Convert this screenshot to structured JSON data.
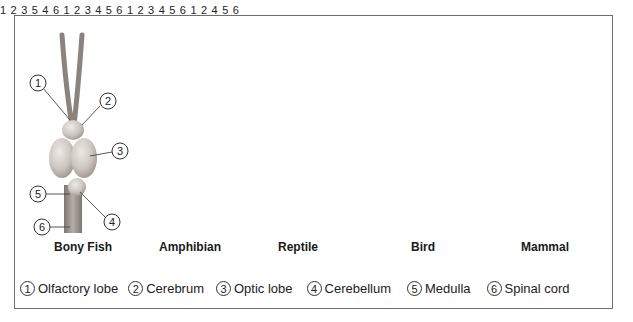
{
  "diagram": {
    "animals": [
      {
        "id": "bony-fish",
        "caption": "Bony Fish"
      },
      {
        "id": "amphibian",
        "caption": "Amphibian"
      },
      {
        "id": "reptile",
        "caption": "Reptile"
      },
      {
        "id": "bird",
        "caption": "Bird"
      },
      {
        "id": "mammal",
        "caption": "Mammal"
      }
    ],
    "callout_numbers": [
      "1",
      "2",
      "3",
      "4",
      "5",
      "6"
    ]
  },
  "legend": [
    {
      "num": "1",
      "label": "Olfactory lobe"
    },
    {
      "num": "2",
      "label": "Cerebrum"
    },
    {
      "num": "3",
      "label": "Optic lobe"
    },
    {
      "num": "4",
      "label": "Cerebellum"
    },
    {
      "num": "5",
      "label": "Medulla"
    },
    {
      "num": "6",
      "label": "Spinal cord"
    }
  ],
  "colors": {
    "frame": "#6e6e6e",
    "brain_light": "#e2ddd8",
    "brain_mid": "#c9c2bc",
    "brain_dark": "#8f8780",
    "text": "#222222"
  }
}
